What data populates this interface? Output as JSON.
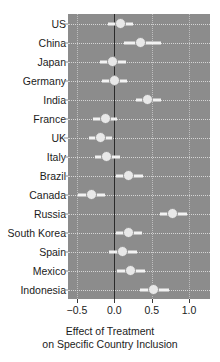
{
  "chart_data": {
    "type": "scatter",
    "title": "",
    "subtitle": "",
    "xlabel_line1": "Effect of Treatment",
    "xlabel_line2": "on Specific Country Inclusion",
    "ylabel": "",
    "xlim": [
      -0.62,
      1.28
    ],
    "xticks": [
      -0.5,
      0.0,
      0.5,
      1.0
    ],
    "xticklabels": [
      "−0.5",
      "0.0",
      "0.5",
      "1.0"
    ],
    "grid": true,
    "legend": "none",
    "reference_line": 0.0,
    "panel_background": "#8c8c8c",
    "point_color": "#e8e8e8",
    "error_bar_color": "#f2f2f2",
    "categories": [
      "US",
      "China",
      "Japan",
      "Germany",
      "India",
      "France",
      "UK",
      "Italy",
      "Brazil",
      "Canada",
      "Russia",
      "South Korea",
      "Spain",
      "Mexico",
      "Indonesia"
    ],
    "series": [
      {
        "name": "Effect of Treatment",
        "estimates": [
          0.08,
          0.35,
          -0.02,
          0.0,
          0.45,
          -0.12,
          -0.19,
          -0.1,
          0.19,
          -0.3,
          0.78,
          0.19,
          0.11,
          0.22,
          0.52
        ],
        "ci_low": [
          -0.08,
          0.13,
          -0.19,
          -0.17,
          0.29,
          -0.28,
          -0.34,
          -0.26,
          0.02,
          -0.48,
          0.61,
          0.02,
          -0.07,
          0.04,
          0.35
        ],
        "ci_high": [
          0.25,
          0.62,
          0.15,
          0.17,
          0.62,
          0.04,
          -0.03,
          0.07,
          0.38,
          -0.12,
          0.97,
          0.37,
          0.3,
          0.41,
          0.73
        ]
      }
    ]
  }
}
